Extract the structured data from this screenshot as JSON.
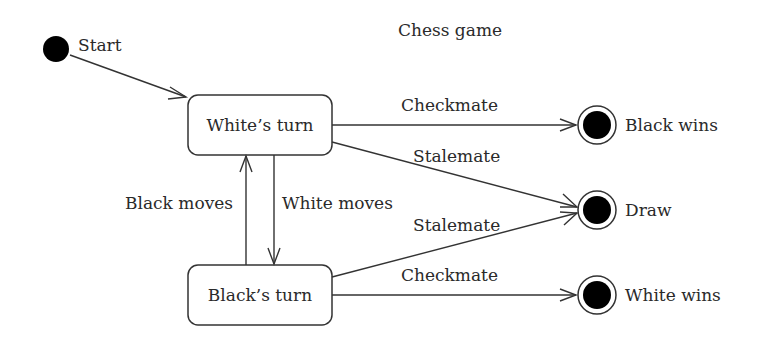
{
  "title": "Chess game",
  "initial_state": {
    "label": "Start"
  },
  "states": [
    {
      "id": "white_turn",
      "label": "White’s turn"
    },
    {
      "id": "black_turn",
      "label": "Black’s turn"
    }
  ],
  "final_states": [
    {
      "id": "black_wins",
      "label": "Black wins"
    },
    {
      "id": "draw",
      "label": "Draw"
    },
    {
      "id": "white_wins",
      "label": "White wins"
    }
  ],
  "transitions": [
    {
      "from": "start",
      "to": "white_turn",
      "label": ""
    },
    {
      "from": "white_turn",
      "to": "black_wins",
      "label": "Checkmate"
    },
    {
      "from": "white_turn",
      "to": "draw",
      "label": "Stalemate"
    },
    {
      "from": "white_turn",
      "to": "black_turn",
      "label": "White moves"
    },
    {
      "from": "black_turn",
      "to": "white_turn",
      "label": "Black moves"
    },
    {
      "from": "black_turn",
      "to": "draw",
      "label": "Stalemate"
    },
    {
      "from": "black_turn",
      "to": "white_wins",
      "label": "Checkmate"
    }
  ]
}
